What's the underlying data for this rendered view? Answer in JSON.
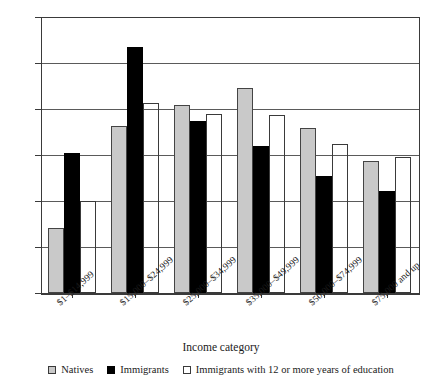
{
  "chart_data": {
    "type": "bar",
    "title": "",
    "xlabel": "Income category",
    "ylabel": "",
    "ylim": [
      0.0,
      30.0
    ],
    "ytick_step": 5.0,
    "yticks": [
      "0.0",
      "5.0",
      "10.0",
      "15.0",
      "20.0",
      "25.0",
      "30.0"
    ],
    "ytick_values": [
      0.0,
      5.0,
      10.0,
      15.0,
      20.0,
      25.0,
      30.0
    ],
    "grid": true,
    "legend_position": "bottom",
    "categories": [
      "$1–$14,999",
      "$15,000–$24,999",
      "$25,000–$34,999",
      "$35,000–$49,999",
      "$50,000–$74,999",
      "$75,000 and up"
    ],
    "series": [
      {
        "name": "Natives",
        "color": "#c9c9c9",
        "values": [
          7.1,
          18.2,
          20.4,
          22.3,
          17.9,
          14.3
        ]
      },
      {
        "name": "Immigrants",
        "color": "#000000",
        "values": [
          15.2,
          26.7,
          18.7,
          16.0,
          12.7,
          11.1
        ]
      },
      {
        "name": "Immigrants with 12 or more years of education",
        "color": "#ffffff",
        "values": [
          10.0,
          20.6,
          19.5,
          19.4,
          16.2,
          14.8
        ]
      }
    ]
  },
  "axis": {
    "x_title": "Income category"
  },
  "legend": {
    "items": [
      {
        "label": "Natives",
        "swatch": "legend-swatch-natives"
      },
      {
        "label": "Immigrants",
        "swatch": "legend-swatch-immigrants"
      },
      {
        "label": "Immigrants with 12 or more years of education",
        "swatch": "legend-swatch-immigrants-education"
      }
    ]
  }
}
